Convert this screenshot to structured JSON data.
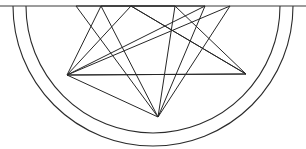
{
  "figure": {
    "type": "geometric-line-drawing",
    "canvas": {
      "width": 306,
      "height": 149,
      "background": "#ffffff"
    },
    "stroke_color": "#262626",
    "stroke_width": 1,
    "center": {
      "x": 153,
      "y": 6
    },
    "arcs": [
      {
        "name": "outer-arc",
        "cx": 153,
        "cy": 6,
        "r": 140,
        "start_deg": 0,
        "end_deg": 180,
        "color": "#2b2b2b"
      },
      {
        "name": "inner-arc",
        "cx": 153,
        "cy": 6,
        "r": 127,
        "start_deg": 0,
        "end_deg": 180,
        "color": "#2b2b2b"
      }
    ],
    "diameter": {
      "name": "top-diameter",
      "x1": 0,
      "y1": 6,
      "x2": 306,
      "y2": 6,
      "color": "#3a3a3a"
    },
    "chord": {
      "name": "horizontal-chord",
      "x1": 67,
      "y1": 75,
      "x2": 246,
      "y2": 74,
      "color": "#333333"
    },
    "vertices": [
      {
        "id": "v0",
        "label": "A",
        "x": 67,
        "y": 75
      },
      {
        "id": "v1",
        "label": "B",
        "x": 76,
        "y": 6
      },
      {
        "id": "v2",
        "label": "C",
        "x": 101,
        "y": 6
      },
      {
        "id": "v3",
        "label": "D",
        "x": 131,
        "y": 6
      },
      {
        "id": "v4",
        "label": "E",
        "x": 175,
        "y": 6
      },
      {
        "id": "v5",
        "label": "F",
        "x": 205,
        "y": 6
      },
      {
        "id": "v6",
        "label": "G",
        "x": 230,
        "y": 6
      },
      {
        "id": "v7",
        "label": "H",
        "x": 246,
        "y": 74
      },
      {
        "id": "v8",
        "label": "I",
        "x": 158,
        "y": 117
      }
    ],
    "edges": [
      {
        "from": "v0",
        "to": "v2"
      },
      {
        "from": "v0",
        "to": "v3"
      },
      {
        "from": "v0",
        "to": "v5"
      },
      {
        "from": "v0",
        "to": "v6"
      },
      {
        "from": "v0",
        "to": "v7"
      },
      {
        "from": "v0",
        "to": "v8"
      },
      {
        "from": "v1",
        "to": "v8"
      },
      {
        "from": "v2",
        "to": "v8"
      },
      {
        "from": "v3",
        "to": "v7"
      },
      {
        "from": "v4",
        "to": "v8"
      },
      {
        "from": "v5",
        "to": "v8"
      },
      {
        "from": "v6",
        "to": "v8"
      },
      {
        "from": "v7",
        "to": "v4"
      },
      {
        "from": "v7",
        "to": "v3"
      },
      {
        "from": "v1",
        "to": "v4"
      },
      {
        "from": "v2",
        "to": "v5"
      }
    ],
    "arc_feet": [
      {
        "name": "outer-arc-left-foot",
        "x": 13,
        "y": 6
      },
      {
        "name": "inner-arc-left-foot",
        "x": 26,
        "y": 6
      },
      {
        "name": "inner-arc-right-foot",
        "x": 280,
        "y": 6
      },
      {
        "name": "outer-arc-right-foot",
        "x": 293,
        "y": 6
      }
    ]
  }
}
